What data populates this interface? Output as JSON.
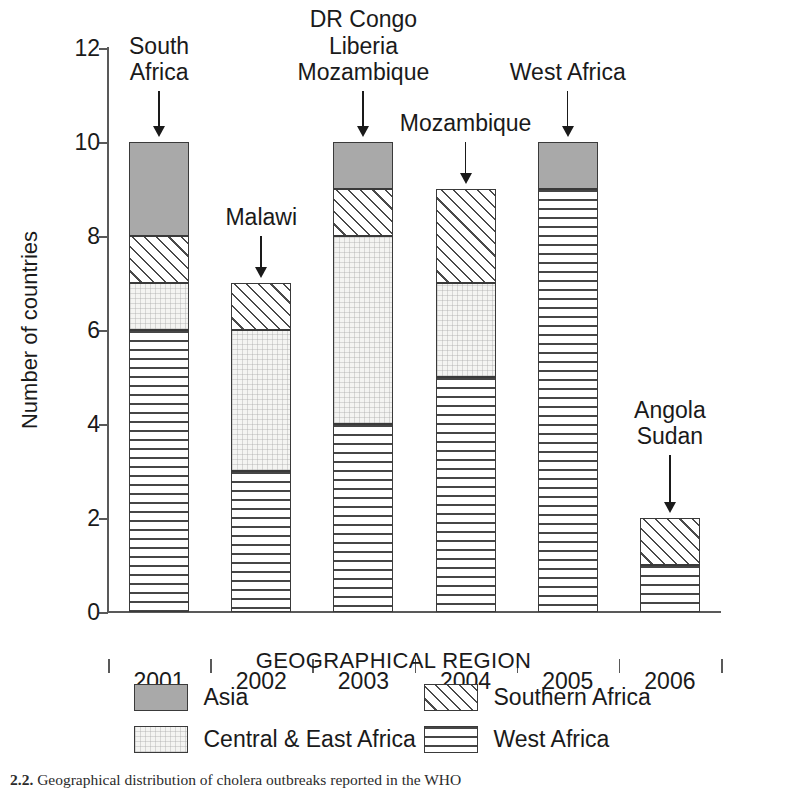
{
  "chart_data": {
    "type": "bar",
    "stacked": true,
    "title": "",
    "xlabel": "GEOGRAPHICAL REGION",
    "ylabel": "Number of countries",
    "categories": [
      "2001",
      "2002",
      "2003",
      "2004",
      "2005",
      "2006"
    ],
    "ylim": [
      0,
      12
    ],
    "yticks": [
      0,
      2,
      4,
      6,
      8,
      10,
      12
    ],
    "ytick_labels": [
      "0",
      "2",
      "4",
      "6",
      "8",
      "10",
      "12"
    ],
    "grid": false,
    "legend_position": "below-axis",
    "series": [
      {
        "name": "West Africa",
        "key": "west",
        "values": [
          6,
          3,
          4,
          5,
          9,
          1
        ]
      },
      {
        "name": "Central & East Africa",
        "key": "central",
        "values": [
          1,
          3,
          4,
          2,
          0,
          0
        ]
      },
      {
        "name": "Southern Africa",
        "key": "southern",
        "values": [
          1,
          1,
          1,
          2,
          0,
          1
        ]
      },
      {
        "name": "Asia",
        "key": "asia",
        "values": [
          2,
          0,
          1,
          0,
          1,
          0
        ]
      }
    ],
    "totals": [
      10,
      7,
      10,
      9,
      10,
      2
    ],
    "annotations": [
      {
        "category": "2001",
        "text": "South\nAfrica",
        "points_to_total": 10
      },
      {
        "category": "2002",
        "text": "Malawi",
        "points_to_total": 7
      },
      {
        "category": "2003",
        "text": "DR Congo\nLiberia\nMozambique",
        "points_to_total": 10
      },
      {
        "category": "2004",
        "text": "Mozambique",
        "points_to_total": 9
      },
      {
        "category": "2005",
        "text": "West Africa",
        "points_to_total": 10
      },
      {
        "category": "2006",
        "text": "Angola\nSudan",
        "points_to_total": 2
      }
    ]
  },
  "axes": {
    "y_title": "Number of countries",
    "x_title": "GEOGRAPHICAL REGION",
    "y_tick_labels": [
      "12",
      "10",
      "8",
      "6",
      "4",
      "2",
      "0"
    ],
    "x_tick_labels": [
      "2001",
      "2002",
      "2003",
      "2004",
      "2005",
      "2006"
    ]
  },
  "legend": {
    "title": "GEOGRAPHICAL REGION",
    "items": [
      {
        "label": "Asia",
        "pattern": "solid-gray",
        "color": "#a9a9a9"
      },
      {
        "label": "Southern Africa",
        "pattern": "diagonal-hatch",
        "color": "#ffffff"
      },
      {
        "label": "Central & East Africa",
        "pattern": "fine-grid-light",
        "color": "#f4f4f2"
      },
      {
        "label": "West Africa",
        "pattern": "horizontal-dash",
        "color": "#ffffff"
      }
    ]
  },
  "annotations": {
    "a2001": "South\nAfrica",
    "a2002": "Malawi",
    "a2003": "DR Congo\nLiberia\nMozambique",
    "a2004": "Mozambique",
    "a2005": "West Africa",
    "a2006": "Angola\nSudan"
  },
  "caption": {
    "label": "2.2.",
    "text": "Geographical distribution of cholera outbreaks reported in the WHO"
  },
  "colors": {
    "axis": "#595959",
    "text": "#1a1a1a",
    "asia": "#a9a9a9",
    "outline": "#3a3a3a"
  }
}
